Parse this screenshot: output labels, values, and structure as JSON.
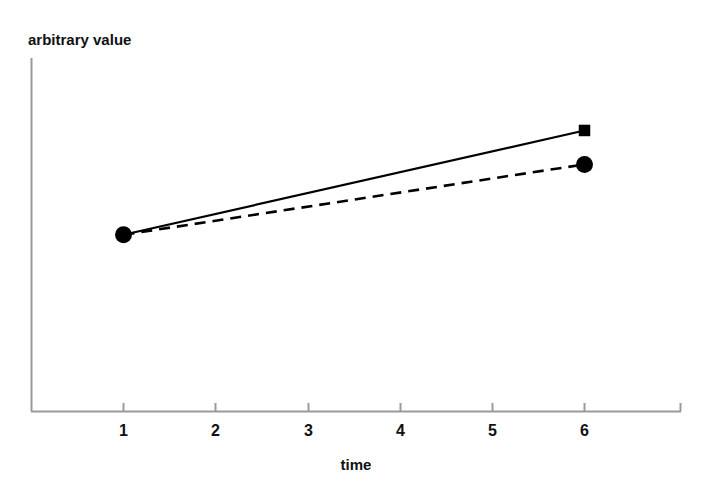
{
  "chart_data": {
    "type": "line",
    "title": "",
    "subtitle": "",
    "xlabel": "time",
    "ylabel": "arbitrary value",
    "x": [
      1,
      6
    ],
    "xlim": [
      0.5,
      6.7
    ],
    "ylim": [
      0,
      1
    ],
    "xticks": [
      1,
      2,
      3,
      4,
      5,
      6
    ],
    "xtick_labels": [
      "1",
      "2",
      "3",
      "4",
      "5",
      "6"
    ],
    "yticks": [],
    "ytick_labels": [],
    "grid": false,
    "legend": "none",
    "series": [
      {
        "name": "solid-series",
        "x": [
          1,
          6
        ],
        "values": [
          0.5,
          0.795
        ],
        "linestyle": "solid",
        "marker": "square",
        "color": "#000000"
      },
      {
        "name": "dashed-series",
        "x": [
          1,
          6
        ],
        "values": [
          0.5,
          0.699
        ],
        "linestyle": "dashed",
        "marker": "circle",
        "color": "#000000"
      }
    ],
    "annotations": [],
    "colors": {
      "axis": "#9a9a9a",
      "line": "#000000",
      "marker": "#000000",
      "text": "#111111",
      "background": "#ffffff"
    }
  }
}
